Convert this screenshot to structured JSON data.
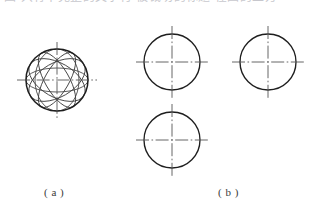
{
  "page": {
    "width": 321,
    "height": 213,
    "background": "#ffffff",
    "ink_color": "#262626",
    "centerline_color": "#555555",
    "construction_color": "#3d3d3d"
  },
  "header": {
    "clipped_text": "图 只有不完整的文字行 被裁切的标题 在图的上方",
    "note": "clipped-cjk-heading-row"
  },
  "figures": [
    {
      "id": "a",
      "caption": "( a )",
      "caption_x": 44,
      "caption_y": 186,
      "description": "sphere construction: outer circle with inscribed rotated ellipses and dash-dot centerlines",
      "center": {
        "x": 57,
        "y": 80
      },
      "radius": 31,
      "centerlines": {
        "horizontal": {
          "x1": 17,
          "x2": 97,
          "y": 80
        },
        "vertical": {
          "y1": 42,
          "y2": 119,
          "x": 57
        }
      },
      "construction_ellipses": [
        {
          "rx": 31,
          "ry": 12,
          "rotate": 0
        },
        {
          "rx": 31,
          "ry": 12,
          "rotate": 60
        },
        {
          "rx": 31,
          "ry": 12,
          "rotate": 120
        },
        {
          "rx": 31,
          "ry": 17,
          "rotate": 30
        },
        {
          "rx": 31,
          "ry": 17,
          "rotate": 150
        },
        {
          "rx": 31,
          "ry": 22,
          "rotate": 90
        }
      ]
    },
    {
      "id": "b",
      "caption": "( b )",
      "caption_x": 218,
      "caption_y": 186,
      "description": "three plain projection circles each with dash-dot centerlines",
      "circles": [
        {
          "name": "top-view-circle",
          "center": {
            "x": 172,
            "y": 62
          },
          "radius": 28,
          "centerlines": {
            "horizontal": {
              "x1": 136,
              "x2": 208,
              "y": 62
            },
            "vertical": {
              "y1": 26,
              "y2": 98,
              "x": 172
            }
          }
        },
        {
          "name": "side-view-circle",
          "center": {
            "x": 268,
            "y": 62
          },
          "radius": 28,
          "centerlines": {
            "horizontal": {
              "x1": 232,
              "x2": 304,
              "y": 62
            },
            "vertical": {
              "y1": 26,
              "y2": 98,
              "x": 268
            }
          }
        },
        {
          "name": "front-view-circle",
          "center": {
            "x": 172,
            "y": 140
          },
          "radius": 28,
          "centerlines": {
            "horizontal": {
              "x1": 136,
              "x2": 208,
              "y": 140
            },
            "vertical": {
              "y1": 104,
              "y2": 176,
              "x": 172
            }
          }
        }
      ]
    }
  ]
}
